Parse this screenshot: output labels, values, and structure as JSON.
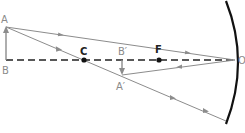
{
  "diagram": {
    "title": "",
    "type": "concave mirror ray diagram",
    "labels": {
      "A": "A",
      "B": "B",
      "C": "C",
      "B_prime": "B′",
      "A_prime": "A′",
      "F": "F",
      "O": "O"
    },
    "colors": {
      "ray": "#8c8c8c",
      "axis": "#222222",
      "mirror": "#111111",
      "label": "#8a8a8a",
      "point": "#111111"
    },
    "points": [
      {
        "name": "C",
        "role": "center-of-curvature"
      },
      {
        "name": "F",
        "role": "focal-point"
      },
      {
        "name": "O",
        "role": "pole"
      }
    ],
    "objects": [
      {
        "name": "AB",
        "role": "object",
        "direction": "upright"
      },
      {
        "name": "A′B′",
        "role": "image",
        "direction": "inverted"
      }
    ]
  }
}
